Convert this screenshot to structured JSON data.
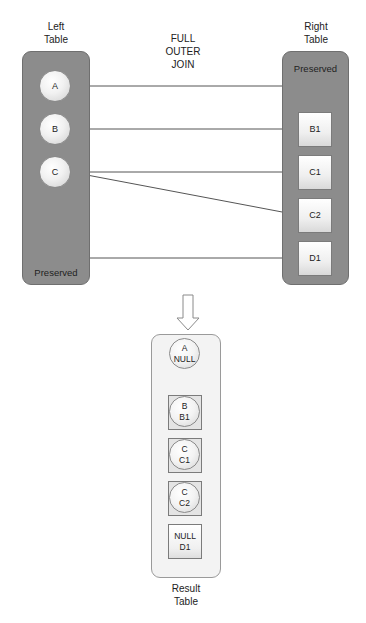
{
  "title": {
    "line1": "FULL",
    "line2": "OUTER",
    "line3": "JOIN"
  },
  "left_table": {
    "label_line1": "Left",
    "label_line2": "Table",
    "preserved_label": "Preserved",
    "rows": [
      {
        "key": "A"
      },
      {
        "key": "B"
      },
      {
        "key": "C"
      }
    ]
  },
  "right_table": {
    "label_line1": "Right",
    "label_line2": "Table",
    "preserved_label": "Preserved",
    "rows": [
      {
        "key": "B1"
      },
      {
        "key": "C1"
      },
      {
        "key": "C2"
      },
      {
        "key": "D1"
      }
    ]
  },
  "connections": [
    {
      "from": "A",
      "to": "Preserved (right)"
    },
    {
      "from": "B",
      "to": "B1"
    },
    {
      "from": "C",
      "to": "C1"
    },
    {
      "from": "C",
      "to": "C2"
    },
    {
      "from": "Preserved (left)",
      "to": "D1"
    }
  ],
  "arrow": {
    "icon": "down-arrow-icon"
  },
  "result_table": {
    "label_line1": "Result",
    "label_line2": "Table",
    "rows": [
      {
        "left": "A",
        "right": "NULL",
        "shape": "circle"
      },
      {
        "left": "B",
        "right": "B1",
        "shape": "circle-in-box"
      },
      {
        "left": "C",
        "right": "C1",
        "shape": "circle-in-box"
      },
      {
        "left": "C",
        "right": "C2",
        "shape": "circle-in-box"
      },
      {
        "left": "NULL",
        "right": "D1",
        "shape": "box"
      }
    ]
  },
  "colors": {
    "panel": "#8c8c8c",
    "panel_border": "#6f6f6f",
    "line": "#555555",
    "result_panel": "#f3f3f3"
  }
}
